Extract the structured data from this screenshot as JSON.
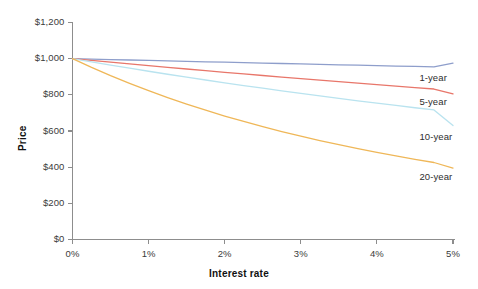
{
  "chart_data": {
    "type": "line",
    "title": "",
    "subtitle": "",
    "xlabel": "Interest rate",
    "ylabel": "Price",
    "xlim": [
      0,
      5
    ],
    "ylim": [
      0,
      1200
    ],
    "grid": false,
    "legend_position": "right-inline",
    "x_tick_labels": [
      "0%",
      "1%",
      "2%",
      "3%",
      "4%",
      "5%"
    ],
    "x_tick_values": [
      0,
      1,
      2,
      3,
      4,
      5
    ],
    "y_tick_labels": [
      "$0",
      "$200",
      "$400",
      "$600",
      "$800",
      "$1,000",
      "$1,200"
    ],
    "y_tick_values": [
      0,
      200,
      400,
      600,
      800,
      1000,
      1200
    ],
    "x": [
      0,
      0.25,
      0.5,
      0.75,
      1,
      1.25,
      1.5,
      1.75,
      2,
      2.25,
      2.5,
      2.75,
      3,
      3.25,
      3.5,
      3.75,
      4,
      4.25,
      4.5,
      4.75,
      5
    ],
    "series": [
      {
        "name": "1-year",
        "color": "#8e9ecb",
        "label": "1-year",
        "label_x": 4.9,
        "label_y": 893,
        "values": [
          1000,
          997.5,
          995.0,
          992.5,
          990.1,
          987.6,
          985.2,
          982.8,
          980.4,
          978.0,
          975.6,
          973.2,
          970.9,
          968.5,
          966.2,
          963.9,
          961.5,
          959.2,
          957.0,
          954.7,
          975
        ]
      },
      {
        "name": "5-year",
        "color": "#e8766a",
        "label": "5-year",
        "label_x": 4.9,
        "label_y": 760,
        "values": [
          1000,
          990.2,
          980.5,
          970.9,
          961.4,
          952.1,
          942.8,
          933.7,
          924.7,
          915.7,
          906.9,
          898.2,
          889.6,
          881.1,
          872.7,
          864.4,
          856.2,
          848.1,
          840.1,
          832.2,
          805
        ]
      },
      {
        "name": "10-year",
        "color": "#b9e3ef",
        "label": "10-year",
        "label_x": 4.9,
        "label_y": 565,
        "values": [
          1000,
          982.0,
          964.4,
          947.2,
          930.4,
          913.9,
          897.8,
          882.0,
          866.5,
          851.4,
          836.6,
          822.1,
          807.9,
          794.0,
          780.4,
          767.1,
          754.0,
          741.2,
          728.7,
          716.4,
          630
        ]
      },
      {
        "name": "20-year",
        "color": "#efb758",
        "label": "20-year",
        "label_x": 4.9,
        "label_y": 345,
        "values": [
          1000,
          951.6,
          906.0,
          863.2,
          822.8,
          784.7,
          748.8,
          714.9,
          682.9,
          652.7,
          624.1,
          597.0,
          571.4,
          547.2,
          524.2,
          502.4,
          481.7,
          462.1,
          443.5,
          425.8,
          395
        ]
      }
    ]
  },
  "axes": {
    "x_axis_color": "#8d8d8d",
    "y_axis_color": "#8d8d8d"
  }
}
